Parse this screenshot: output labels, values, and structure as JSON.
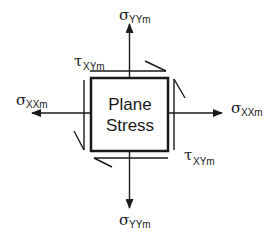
{
  "diagram": {
    "box": {
      "line1": "Plane",
      "line2": "Stress"
    },
    "labels": {
      "sigma_yy_top": {
        "symbol": "σ",
        "subscript": "YYm"
      },
      "sigma_yy_bottom": {
        "symbol": "σ",
        "subscript": "YYm"
      },
      "sigma_xx_left": {
        "symbol": "σ",
        "subscript": "XXm"
      },
      "sigma_xx_right": {
        "symbol": "σ",
        "subscript": "XXm"
      },
      "tau_xy_top": {
        "symbol": "τ",
        "subscript": "XYm"
      },
      "tau_xy_bottom": {
        "symbol": "τ",
        "subscript": "XYm"
      }
    },
    "colors": {
      "stroke": "#1a1a1a",
      "background": "#ffffff"
    }
  }
}
